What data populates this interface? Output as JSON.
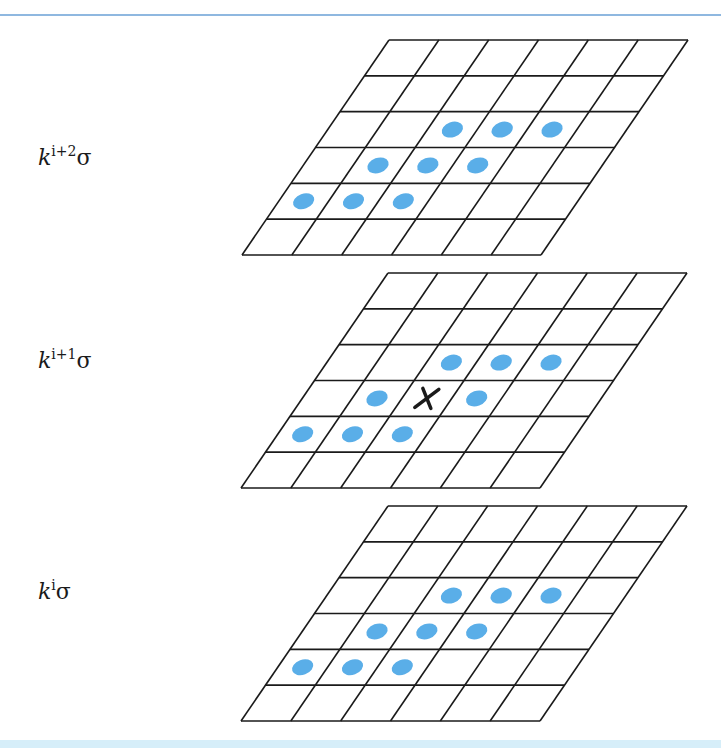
{
  "diagram": {
    "type": "scale-space-neighborhood",
    "colors": {
      "grid_line": "#1a1a1a",
      "neighbor_dot": "#5aaee8",
      "center_marker": "#1a1a1a",
      "top_rule": "#8fb8e0",
      "bottom_band": "#d6eef9"
    },
    "grid": {
      "rows": 6,
      "cols": 6
    },
    "layers": [
      {
        "id": "top",
        "label": {
          "base": "k",
          "exp": "i+2",
          "suffix": "σ"
        },
        "neighbors": [
          [
            2,
            2
          ],
          [
            2,
            3
          ],
          [
            2,
            4
          ],
          [
            3,
            1
          ],
          [
            3,
            2
          ],
          [
            3,
            3
          ],
          [
            4,
            0
          ],
          [
            4,
            1
          ],
          [
            4,
            2
          ]
        ],
        "center_marker": false
      },
      {
        "id": "middle",
        "label": {
          "base": "k",
          "exp": "i+1",
          "suffix": "σ"
        },
        "neighbors": [
          [
            2,
            2
          ],
          [
            2,
            3
          ],
          [
            2,
            4
          ],
          [
            3,
            1
          ],
          [
            3,
            3
          ],
          [
            4,
            0
          ],
          [
            4,
            1
          ],
          [
            4,
            2
          ]
        ],
        "center_marker": true,
        "center_cell": [
          3,
          2
        ],
        "center_symbol": "X"
      },
      {
        "id": "bottom",
        "label": {
          "base": "k",
          "exp": "i",
          "suffix": "σ"
        },
        "neighbors": [
          [
            2,
            2
          ],
          [
            2,
            3
          ],
          [
            2,
            4
          ],
          [
            3,
            1
          ],
          [
            3,
            2
          ],
          [
            3,
            3
          ],
          [
            4,
            0
          ],
          [
            4,
            1
          ],
          [
            4,
            2
          ]
        ],
        "center_marker": false
      }
    ]
  }
}
